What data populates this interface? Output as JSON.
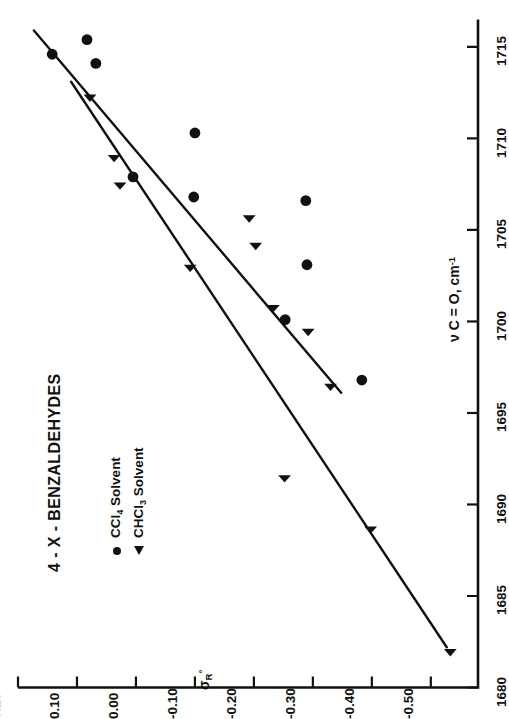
{
  "figure": {
    "title": "4 - X - BENZALDEHYDES",
    "background_color": "#ffffff",
    "ink_color": "#111111",
    "orientation": "rotated-90-ccw"
  },
  "legend": {
    "items": [
      {
        "symbol": "circle",
        "label_prefix": "CCl",
        "label_sub": "4",
        "label_suffix": " Solvent",
        "label_plain": "CCl4 Solvent"
      },
      {
        "symbol": "triangle",
        "label_prefix": "CHCl",
        "label_sub": "3",
        "label_suffix": " Solvent",
        "label_plain": "CHCl3 Solvent"
      }
    ]
  },
  "axes": {
    "sigma": {
      "label_main": "σ",
      "label_sub": "R",
      "label_sup": "°",
      "label_plain": "σR°",
      "ticks": [
        "0.20",
        "0.10",
        "0.00",
        "-0.10",
        "-0.20",
        "-0.30",
        "-0.40",
        "-0.50"
      ],
      "tick_values": [
        0.2,
        0.1,
        0.0,
        -0.1,
        -0.2,
        -0.3,
        -0.4,
        -0.5
      ],
      "min": -0.58,
      "max": 0.2
    },
    "nu": {
      "label_plain": "ν C = O, cm-1",
      "label_head": "ν C = O, cm",
      "label_sup": "-1",
      "ticks": [
        "1680",
        "1685",
        "1690",
        "1695",
        "1700",
        "1705",
        "1710",
        "1715"
      ],
      "tick_values": [
        1680,
        1685,
        1690,
        1695,
        1700,
        1705,
        1710,
        1715
      ],
      "min": 1680,
      "max": 1716.5
    }
  },
  "chart_data": {
    "type": "scatter",
    "title": "4 - X - BENZALDEHYDES",
    "xlabel": "ν C = O, cm-1",
    "ylabel": "σR°",
    "xlim": [
      1680,
      1716.5
    ],
    "ylim": [
      -0.58,
      0.2
    ],
    "grid": false,
    "legend_position": "lower-left",
    "series": [
      {
        "name": "CCl4 Solvent",
        "marker": "circle",
        "color": "#111111",
        "points": [
          {
            "x": 1714.6,
            "y": 0.142
          },
          {
            "x": 1715.4,
            "y": 0.083
          },
          {
            "x": 1714.1,
            "y": 0.068
          },
          {
            "x": 1710.3,
            "y": -0.1
          },
          {
            "x": 1707.9,
            "y": 0.005
          },
          {
            "x": 1706.8,
            "y": -0.098
          },
          {
            "x": 1706.6,
            "y": -0.288
          },
          {
            "x": 1703.1,
            "y": -0.29
          },
          {
            "x": 1700.1,
            "y": -0.253
          },
          {
            "x": 1696.8,
            "y": -0.383
          }
        ]
      },
      {
        "name": "CHCl3 Solvent",
        "marker": "triangle",
        "color": "#111111",
        "points": [
          {
            "x": 1712.4,
            "y": 0.078
          },
          {
            "x": 1709.1,
            "y": 0.037
          },
          {
            "x": 1707.6,
            "y": 0.027
          },
          {
            "x": 1705.8,
            "y": -0.192
          },
          {
            "x": 1704.3,
            "y": -0.203
          },
          {
            "x": 1703.1,
            "y": -0.092
          },
          {
            "x": 1700.9,
            "y": -0.233
          },
          {
            "x": 1699.6,
            "y": -0.292
          },
          {
            "x": 1696.6,
            "y": -0.33
          },
          {
            "x": 1691.6,
            "y": -0.252
          },
          {
            "x": 1688.8,
            "y": -0.398
          },
          {
            "x": 1682.1,
            "y": -0.533
          }
        ]
      }
    ],
    "fit_lines": [
      {
        "name": "CCl4 regression",
        "x0": 1715.9,
        "y0": 0.173,
        "x1": 1696.1,
        "y1": -0.348
      },
      {
        "name": "CHCl3 regression",
        "x0": 1713.1,
        "y0": 0.11,
        "x1": 1682.2,
        "y1": -0.527
      }
    ]
  }
}
